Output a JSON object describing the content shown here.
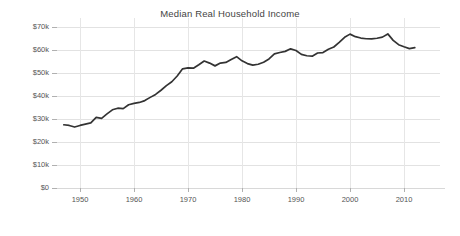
{
  "chart_data": {
    "type": "line",
    "title": "Median Real Household Income",
    "xlabel": "",
    "ylabel": "",
    "xlim": [
      1946,
      2013
    ],
    "ylim": [
      0,
      72000
    ],
    "grid": true,
    "legend": false,
    "legend_position": "none",
    "y_ticks": [
      0,
      10000,
      20000,
      30000,
      40000,
      50000,
      60000,
      70000
    ],
    "y_tick_labels": [
      "$0",
      "$10k",
      "$20k",
      "$30k",
      "$40k",
      "$50k",
      "$60k",
      "$70k"
    ],
    "x_ticks": [
      1950,
      1960,
      1970,
      1980,
      1990,
      2000,
      2010
    ],
    "x_tick_labels": [
      "1950",
      "1960",
      "1970",
      "1980",
      "1990",
      "2000",
      "2010"
    ],
    "line_color": "#333333",
    "grid_color": "#e2e2e2",
    "series": [
      {
        "name": "Median Real Household Income",
        "x": [
          1947,
          1948,
          1949,
          1950,
          1951,
          1952,
          1953,
          1954,
          1955,
          1956,
          1957,
          1958,
          1959,
          1960,
          1961,
          1962,
          1963,
          1964,
          1965,
          1966,
          1967,
          1968,
          1969,
          1970,
          1971,
          1972,
          1973,
          1974,
          1975,
          1976,
          1977,
          1978,
          1979,
          1980,
          1981,
          1982,
          1983,
          1984,
          1985,
          1986,
          1987,
          1988,
          1989,
          1990,
          1991,
          1992,
          1993,
          1994,
          1995,
          1996,
          1997,
          1998,
          1999,
          2000,
          2001,
          2002,
          2003,
          2004,
          2005,
          2006,
          2007,
          2008,
          2009,
          2010,
          2011,
          2012
        ],
        "values": [
          27500,
          27200,
          26500,
          27200,
          27800,
          28300,
          30700,
          30300,
          32200,
          34000,
          34700,
          34500,
          36200,
          36800,
          37200,
          38000,
          39400,
          40700,
          42500,
          44500,
          46200,
          48700,
          51800,
          52200,
          52100,
          53600,
          55200,
          54300,
          53100,
          54300,
          54600,
          55900,
          57100,
          55300,
          54100,
          53400,
          53800,
          54700,
          56100,
          58300,
          58900,
          59400,
          60500,
          59800,
          58100,
          57500,
          57300,
          58700,
          58900,
          60300,
          61300,
          63300,
          65500,
          66900,
          65800,
          65200,
          64900,
          64800,
          65100,
          65600,
          67000,
          64200,
          62300,
          61400,
          60600,
          61000
        ]
      }
    ]
  },
  "axes": {
    "y_labels": [
      "$70k",
      "$60k",
      "$50k",
      "$40k",
      "$30k",
      "$20k",
      "$10k",
      "$0"
    ],
    "x_labels": [
      "1950",
      "1960",
      "1970",
      "1980",
      "1990",
      "2000",
      "2010"
    ]
  }
}
